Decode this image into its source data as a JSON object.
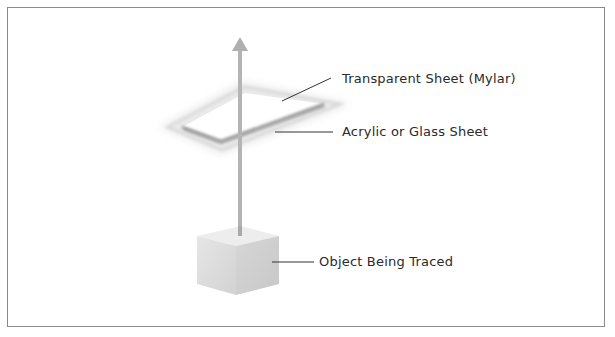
{
  "diagram": {
    "labels": {
      "transparent_sheet": "Transparent Sheet (Mylar)",
      "acrylic_sheet": "Acrylic or Glass Sheet",
      "object": "Object Being Traced"
    },
    "colors": {
      "frame": "#8a8a8a",
      "arrow": "#b8b8b8",
      "cube_top": "#ececec",
      "cube_left": "#dcdcdc",
      "cube_right": "#cfcfcf",
      "leader_line": "#333333"
    }
  }
}
